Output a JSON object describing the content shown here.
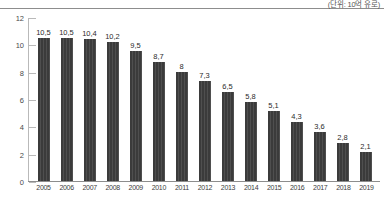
{
  "unit_note": "(단위: 10억 유로)",
  "chart_data": {
    "type": "bar",
    "title": "",
    "subtitle": "",
    "xlabel": "",
    "ylabel": "",
    "unit_label": "(단위: 10억 유로)",
    "decimal_separator": ",",
    "grid": false,
    "legend": false,
    "ylim": [
      0,
      12
    ],
    "yticks": [
      "0",
      "2",
      "4",
      "6",
      "8",
      "10",
      "12"
    ],
    "bar_color": "#3b3b3b",
    "categories": [
      "2005",
      "2006",
      "2007",
      "2008",
      "2009",
      "2010",
      "2011",
      "2012",
      "2013",
      "2014",
      "2015",
      "2016",
      "2017",
      "2018",
      "2019"
    ],
    "values": [
      10.5,
      10.5,
      10.4,
      10.2,
      9.5,
      8.7,
      8.0,
      7.3,
      6.5,
      5.8,
      5.1,
      4.3,
      3.6,
      2.8,
      2.1
    ],
    "data_labels": [
      "10,5",
      "10,5",
      "10,4",
      "10,2",
      "9,5",
      "8,7",
      "8",
      "7,3",
      "6,5",
      "5,8",
      "5,1",
      "4,3",
      "3,6",
      "2,8",
      "2,1"
    ]
  }
}
